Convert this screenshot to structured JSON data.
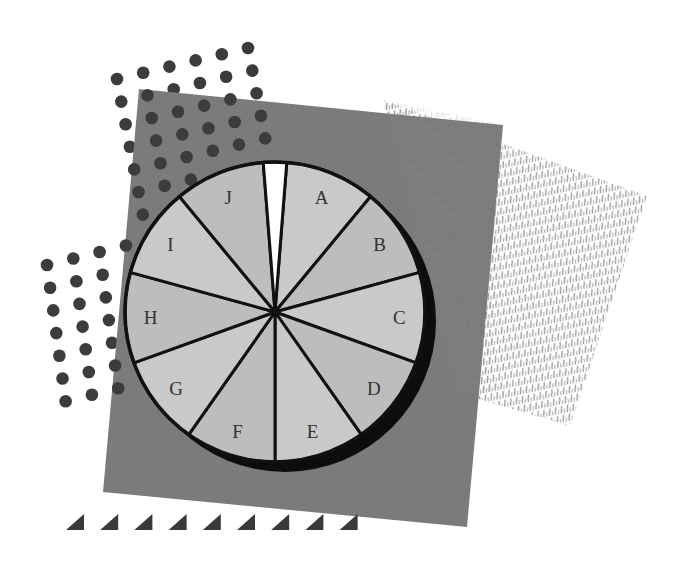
{
  "chart_data": {
    "type": "pie",
    "title": "",
    "categories": [
      "A",
      "B",
      "C",
      "D",
      "E",
      "F",
      "G",
      "H",
      "I",
      "J"
    ],
    "values": [
      9.75,
      9.75,
      9.75,
      9.75,
      9.75,
      9.75,
      9.75,
      9.75,
      9.75,
      9.75
    ],
    "unlabeled_gap": {
      "label": "",
      "value": 2.5,
      "color": "#ffffff"
    },
    "start_angle_deg": 4.5,
    "direction": "clockwise",
    "legend": "none",
    "labels_inside": true
  },
  "colors": {
    "background": "#ffffff",
    "square": "#7b7b7b",
    "sector_light": "#c9c9c9",
    "sector_dark": "#bdbdbd",
    "gap": "#ffffff",
    "outline": "#111111",
    "shadow": "#0d0d0d",
    "dots": "#3c3c3c",
    "hatch": "#8a8a8a",
    "triangles": "#3a3a3a",
    "label": "#333333"
  },
  "decorations": {
    "dot_cluster_top": "dots-pattern",
    "dot_cluster_left": "dots-pattern",
    "hatched_parallelogram": "hatch-pattern",
    "triangle_row_count": 9
  }
}
